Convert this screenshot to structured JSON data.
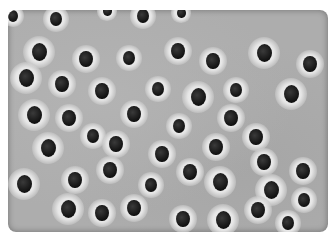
{
  "image": {
    "description": "Grayscale phase-contrast micrograph of cells with bright halos and dark nuclei",
    "background_color": "#adadad",
    "halo_color": "#eeeeee",
    "nucleus_color": "#151515",
    "cells": [
      {
        "x": 5,
        "y": 6,
        "r": 7
      },
      {
        "x": 48,
        "y": 9,
        "r": 8
      },
      {
        "x": 99,
        "y": 1,
        "r": 6
      },
      {
        "x": 135,
        "y": 6,
        "r": 8
      },
      {
        "x": 173,
        "y": 3,
        "r": 6
      },
      {
        "x": 31,
        "y": 42,
        "r": 10
      },
      {
        "x": 78,
        "y": 49,
        "r": 9
      },
      {
        "x": 121,
        "y": 48,
        "r": 8
      },
      {
        "x": 170,
        "y": 41,
        "r": 9
      },
      {
        "x": 205,
        "y": 51,
        "r": 9
      },
      {
        "x": 256,
        "y": 43,
        "r": 10
      },
      {
        "x": 302,
        "y": 54,
        "r": 9
      },
      {
        "x": 18,
        "y": 68,
        "r": 10
      },
      {
        "x": 54,
        "y": 74,
        "r": 9
      },
      {
        "x": 94,
        "y": 81,
        "r": 9
      },
      {
        "x": 150,
        "y": 79,
        "r": 8
      },
      {
        "x": 190,
        "y": 87,
        "r": 10
      },
      {
        "x": 228,
        "y": 80,
        "r": 8
      },
      {
        "x": 283,
        "y": 84,
        "r": 10
      },
      {
        "x": 26,
        "y": 105,
        "r": 10
      },
      {
        "x": 61,
        "y": 108,
        "r": 9
      },
      {
        "x": 85,
        "y": 126,
        "r": 8
      },
      {
        "x": 126,
        "y": 104,
        "r": 9
      },
      {
        "x": 171,
        "y": 116,
        "r": 8
      },
      {
        "x": 223,
        "y": 108,
        "r": 9
      },
      {
        "x": 248,
        "y": 127,
        "r": 9
      },
      {
        "x": 40,
        "y": 138,
        "r": 10
      },
      {
        "x": 108,
        "y": 134,
        "r": 9
      },
      {
        "x": 154,
        "y": 144,
        "r": 9
      },
      {
        "x": 208,
        "y": 137,
        "r": 9
      },
      {
        "x": 256,
        "y": 152,
        "r": 9
      },
      {
        "x": 295,
        "y": 161,
        "r": 9
      },
      {
        "x": 16,
        "y": 174,
        "r": 10
      },
      {
        "x": 67,
        "y": 170,
        "r": 9
      },
      {
        "x": 102,
        "y": 160,
        "r": 9
      },
      {
        "x": 143,
        "y": 175,
        "r": 8
      },
      {
        "x": 182,
        "y": 162,
        "r": 9
      },
      {
        "x": 212,
        "y": 172,
        "r": 10
      },
      {
        "x": 263,
        "y": 180,
        "r": 10
      },
      {
        "x": 296,
        "y": 190,
        "r": 8
      },
      {
        "x": 60,
        "y": 199,
        "r": 10
      },
      {
        "x": 94,
        "y": 203,
        "r": 9
      },
      {
        "x": 126,
        "y": 198,
        "r": 9
      },
      {
        "x": 175,
        "y": 209,
        "r": 9
      },
      {
        "x": 215,
        "y": 210,
        "r": 10
      },
      {
        "x": 250,
        "y": 200,
        "r": 9
      },
      {
        "x": 280,
        "y": 213,
        "r": 8
      }
    ]
  }
}
